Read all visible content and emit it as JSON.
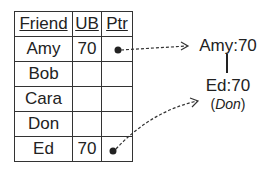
{
  "table": {
    "headers": [
      "Friend",
      "UB",
      "Ptr"
    ],
    "rows": [
      {
        "friend": "Amy",
        "ub": "70",
        "ptr": true
      },
      {
        "friend": "Bob",
        "ub": "",
        "ptr": false
      },
      {
        "friend": "Cara",
        "ub": "",
        "ptr": false
      },
      {
        "friend": "Don",
        "ub": "",
        "ptr": false
      },
      {
        "friend": "Ed",
        "ub": "70",
        "ptr": true
      }
    ]
  },
  "nodes": {
    "top": "Amy:70",
    "bottom": "Ed:70",
    "bottom_sub_open": "(",
    "bottom_sub_name": "Don",
    "bottom_sub_close": ")"
  }
}
